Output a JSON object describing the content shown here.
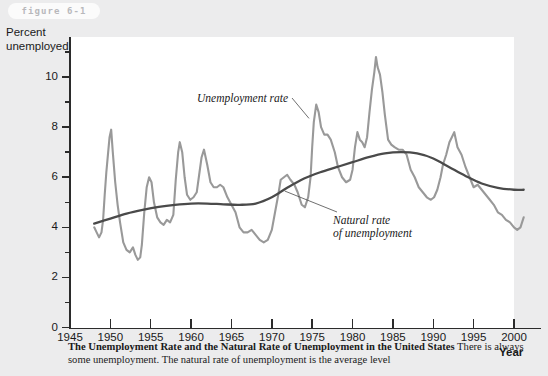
{
  "figure": {
    "tag_label": "figure 6-1"
  },
  "axes": {
    "y_title": "Percent\nunemployed",
    "x_title": "Year",
    "y_ticks": [
      0,
      2,
      4,
      6,
      8,
      10
    ],
    "y_minor_ticks": [
      1,
      3,
      5,
      7,
      9,
      11
    ],
    "x_ticks": [
      1945,
      1950,
      1955,
      1960,
      1965,
      1970,
      1975,
      1980,
      1985,
      1990,
      1995,
      2000
    ]
  },
  "annotations": {
    "unemployment_rate": "Unemployment rate",
    "natural_rate": "Natural rate\nof unemployment"
  },
  "caption": {
    "title": "The Unemployment Rate and the Natural Rate of Unemployment in the United States",
    "body": " There is always some unemployment. The natural rate of unemployment is the average level"
  },
  "colors": {
    "page_background": "#ececed",
    "plot_background": "#ffffff",
    "axis": "#2b2b2b",
    "unemployment_line": "#999999",
    "natural_rate_line": "#4a4a4a",
    "tag_text": "#b8b8bb",
    "tag_background": "#fbfbfb"
  },
  "chart_data": {
    "type": "line",
    "title": "The Unemployment Rate and the Natural Rate of Unemployment in the United States",
    "xlabel": "Year",
    "ylabel": "Percent unemployed",
    "xlim": [
      1945,
      2001.5
    ],
    "ylim": [
      0,
      11.6
    ],
    "grid": false,
    "legend": "annotated inline",
    "series": [
      {
        "name": "Unemployment rate",
        "color": "#999999",
        "x": [
          1948.0,
          1948.3,
          1948.6,
          1948.9,
          1949.1,
          1949.3,
          1949.5,
          1949.7,
          1949.9,
          1950.1,
          1950.3,
          1950.6,
          1950.9,
          1951.2,
          1951.6,
          1952.0,
          1952.4,
          1952.8,
          1953.1,
          1953.4,
          1953.7,
          1953.9,
          1954.2,
          1954.5,
          1954.8,
          1955.1,
          1955.4,
          1955.8,
          1956.2,
          1956.6,
          1957.0,
          1957.4,
          1957.8,
          1958.1,
          1958.4,
          1958.6,
          1958.9,
          1959.2,
          1959.5,
          1959.9,
          1960.3,
          1960.7,
          1961.0,
          1961.3,
          1961.6,
          1962.0,
          1962.4,
          1962.8,
          1963.2,
          1963.6,
          1964.0,
          1964.5,
          1965.0,
          1965.5,
          1966.0,
          1966.5,
          1967.0,
          1967.5,
          1968.0,
          1968.5,
          1969.0,
          1969.5,
          1970.0,
          1970.4,
          1970.8,
          1971.1,
          1971.5,
          1971.9,
          1972.3,
          1972.8,
          1973.2,
          1973.7,
          1974.1,
          1974.5,
          1974.8,
          1975.0,
          1975.2,
          1975.5,
          1975.8,
          1976.1,
          1976.5,
          1976.9,
          1977.3,
          1977.8,
          1978.2,
          1978.7,
          1979.2,
          1979.7,
          1980.0,
          1980.3,
          1980.6,
          1980.9,
          1981.2,
          1981.5,
          1981.8,
          1982.1,
          1982.4,
          1982.7,
          1982.9,
          1983.1,
          1983.4,
          1983.7,
          1984.0,
          1984.4,
          1984.8,
          1985.2,
          1985.7,
          1986.2,
          1986.7,
          1987.2,
          1987.7,
          1988.2,
          1988.7,
          1989.2,
          1989.7,
          1990.1,
          1990.5,
          1990.9,
          1991.2,
          1991.6,
          1992.0,
          1992.3,
          1992.6,
          1993.0,
          1993.5,
          1994.0,
          1994.5,
          1995.0,
          1995.5,
          1996.0,
          1996.5,
          1997.0,
          1997.5,
          1998.0,
          1998.5,
          1999.0,
          1999.5,
          2000.0,
          2000.4,
          2000.8,
          2001.0,
          2001.2
        ],
        "y": [
          4.0,
          3.8,
          3.6,
          3.8,
          4.3,
          5.3,
          6.2,
          6.9,
          7.6,
          7.9,
          7.0,
          5.8,
          4.9,
          4.2,
          3.4,
          3.1,
          3.0,
          3.2,
          2.9,
          2.7,
          2.8,
          3.3,
          4.6,
          5.6,
          6.0,
          5.8,
          5.0,
          4.4,
          4.2,
          4.1,
          4.3,
          4.2,
          4.5,
          5.9,
          7.0,
          7.4,
          7.0,
          6.0,
          5.3,
          5.1,
          5.2,
          5.4,
          6.1,
          6.8,
          7.1,
          6.5,
          5.8,
          5.6,
          5.6,
          5.7,
          5.6,
          5.2,
          4.9,
          4.6,
          4.0,
          3.8,
          3.8,
          3.9,
          3.7,
          3.5,
          3.4,
          3.5,
          3.9,
          4.6,
          5.3,
          5.9,
          6.0,
          6.1,
          5.9,
          5.7,
          5.4,
          4.9,
          4.8,
          5.2,
          6.0,
          7.2,
          8.2,
          8.9,
          8.6,
          8.0,
          7.7,
          7.7,
          7.5,
          7.0,
          6.4,
          6.0,
          5.8,
          5.9,
          6.3,
          7.2,
          7.8,
          7.5,
          7.4,
          7.2,
          7.6,
          8.6,
          9.5,
          10.2,
          10.8,
          10.4,
          10.1,
          9.4,
          8.5,
          7.5,
          7.3,
          7.2,
          7.1,
          7.1,
          6.9,
          6.3,
          6.0,
          5.6,
          5.4,
          5.2,
          5.1,
          5.2,
          5.5,
          6.0,
          6.5,
          6.9,
          7.4,
          7.6,
          7.8,
          7.2,
          6.9,
          6.4,
          6.0,
          5.6,
          5.7,
          5.5,
          5.3,
          5.1,
          4.9,
          4.6,
          4.5,
          4.3,
          4.2,
          4.0,
          3.9,
          4.0,
          4.2,
          4.4
        ]
      },
      {
        "name": "Natural rate of unemployment",
        "color": "#4a4a4a",
        "x": [
          1948,
          1950,
          1952,
          1954,
          1956,
          1958,
          1960,
          1962,
          1964,
          1966,
          1968,
          1970,
          1972,
          1974,
          1976,
          1978,
          1980,
          1982,
          1984,
          1986,
          1988,
          1990,
          1992,
          1994,
          1996,
          1998,
          2000,
          2001.2
        ],
        "y": [
          4.15,
          4.35,
          4.55,
          4.7,
          4.82,
          4.9,
          4.95,
          4.95,
          4.92,
          4.9,
          4.95,
          5.2,
          5.6,
          5.95,
          6.2,
          6.4,
          6.6,
          6.8,
          6.95,
          7.0,
          6.95,
          6.75,
          6.4,
          6.05,
          5.75,
          5.58,
          5.5,
          5.5
        ]
      }
    ]
  }
}
